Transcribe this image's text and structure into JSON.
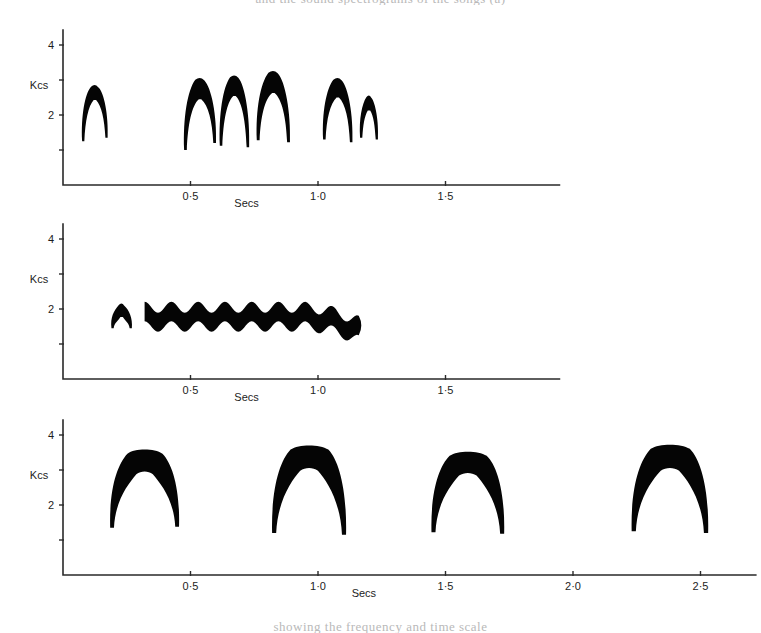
{
  "page": {
    "top_cut_text": "and the sound spectrograms of the songs (a)",
    "bottom_cut_text": "showing the frequency and time scale"
  },
  "chart_data": [
    {
      "type": "area",
      "name": "panel-a",
      "title": "",
      "xlabel": "Secs",
      "ylabel": "Kcs",
      "xlim": [
        0,
        1.95
      ],
      "ylim": [
        0,
        4.6
      ],
      "xticks": [
        0.5,
        1.0,
        1.5
      ],
      "xticklabels": [
        "0·5",
        "1·0",
        "1·5"
      ],
      "yticks": [
        1,
        2,
        3,
        4
      ],
      "yticklabels": [
        "",
        "2",
        "",
        "4"
      ],
      "grid": false,
      "legend": "none",
      "elements": [
        {
          "shape": "inverted-v",
          "t_start": 0.075,
          "t_end": 0.175,
          "f_peak": 2.85,
          "f_low_left": 1.25,
          "f_low_right": 1.35,
          "thickness": 0.42
        },
        {
          "shape": "inverted-v",
          "t_start": 0.475,
          "t_end": 0.6,
          "f_peak": 3.05,
          "f_low_left": 1.0,
          "f_low_right": 1.2,
          "thickness": 0.6
        },
        {
          "shape": "inverted-v",
          "t_start": 0.615,
          "t_end": 0.73,
          "f_peak": 3.12,
          "f_low_left": 1.12,
          "f_low_right": 1.08,
          "thickness": 0.58
        },
        {
          "shape": "inverted-v",
          "t_start": 0.76,
          "t_end": 0.89,
          "f_peak": 3.25,
          "f_low_left": 1.28,
          "f_low_right": 1.22,
          "thickness": 0.62
        },
        {
          "shape": "inverted-v",
          "t_start": 1.02,
          "t_end": 1.135,
          "f_peak": 3.05,
          "f_low_left": 1.3,
          "f_low_right": 1.22,
          "thickness": 0.55
        },
        {
          "shape": "inverted-v",
          "t_start": 1.165,
          "t_end": 1.235,
          "f_peak": 2.55,
          "f_low_left": 1.35,
          "f_low_right": 1.3,
          "thickness": 0.42
        }
      ]
    },
    {
      "type": "area",
      "name": "panel-b",
      "title": "",
      "xlabel": "Secs",
      "ylabel": "Kcs",
      "xlim": [
        0,
        1.95
      ],
      "ylim": [
        0,
        4.6
      ],
      "xticks": [
        0.5,
        1.0,
        1.5
      ],
      "xticklabels": [
        "0·5",
        "1·0",
        "1·5"
      ],
      "yticks": [
        1,
        2,
        3,
        4
      ],
      "yticklabels": [
        "",
        "2",
        "",
        "4"
      ],
      "grid": false,
      "legend": "none",
      "elements": [
        {
          "shape": "inverted-v",
          "t_start": 0.19,
          "t_end": 0.27,
          "f_peak": 2.15,
          "f_low_left": 1.45,
          "f_low_right": 1.45,
          "thickness": 0.38
        },
        {
          "shape": "trill-band",
          "t_start": 0.32,
          "t_end": 1.16,
          "f_upper_mean": 2.05,
          "f_lower_mean": 1.5,
          "cycles": 8,
          "amplitude": 0.16,
          "end_f_low": 1.1
        }
      ]
    },
    {
      "type": "area",
      "name": "panel-c",
      "title": "",
      "xlabel": "Secs",
      "ylabel": "Kcs",
      "xlim": [
        0,
        2.72
      ],
      "ylim": [
        0,
        4.6
      ],
      "xticks": [
        0.5,
        1.0,
        1.5,
        2.0,
        2.5
      ],
      "xticklabels": [
        "0·5",
        "1·0",
        "1·5",
        "2·0",
        "2·5"
      ],
      "yticks": [
        1,
        2,
        3,
        4
      ],
      "yticklabels": [
        "",
        "2",
        "",
        "4"
      ],
      "grid": false,
      "legend": "none",
      "elements": [
        {
          "shape": "dome",
          "t_start": 0.185,
          "t_end": 0.455,
          "f_top": 3.58,
          "f_low_left": 1.35,
          "f_low_right": 1.38,
          "thickness": 0.7
        },
        {
          "shape": "dome",
          "t_start": 0.82,
          "t_end": 1.11,
          "f_top": 3.7,
          "f_low_left": 1.2,
          "f_low_right": 1.15,
          "thickness": 0.72
        },
        {
          "shape": "dome",
          "t_start": 1.445,
          "t_end": 1.73,
          "f_top": 3.52,
          "f_low_left": 1.22,
          "f_low_right": 1.18,
          "thickness": 0.68
        },
        {
          "shape": "dome",
          "t_start": 2.23,
          "t_end": 2.53,
          "f_top": 3.72,
          "f_low_left": 1.25,
          "f_low_right": 1.2,
          "thickness": 0.74
        }
      ]
    }
  ],
  "axes": {
    "y_unit_label": "Kcs",
    "x_unit_label": "Secs"
  }
}
